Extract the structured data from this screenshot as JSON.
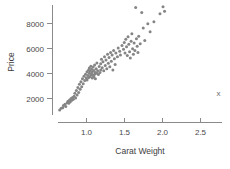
{
  "chart_data": {
    "type": "scatter",
    "title": "",
    "xlabel": "Carat Weight",
    "ylabel": "Price",
    "xlim": [
      0.55,
      2.95
    ],
    "ylim": [
      500,
      9600
    ],
    "xticks": [
      1.0,
      1.5,
      2.0,
      2.5
    ],
    "xtick_labels": [
      "1.0",
      "1.5",
      "2.0",
      "2.5"
    ],
    "yticks": [
      2000,
      4000,
      6000,
      8000
    ],
    "ytick_labels": [
      "2000",
      "4000",
      "6000",
      "8000"
    ],
    "grid": false,
    "legend": "none",
    "marker_color": "#858585",
    "marker_size": 3,
    "annotations": [
      {
        "text": "x",
        "x": 2.75,
        "y": 2150
      }
    ],
    "points": [
      {
        "x": 0.66,
        "y": 1050
      },
      {
        "x": 0.68,
        "y": 1180
      },
      {
        "x": 0.7,
        "y": 1220
      },
      {
        "x": 0.71,
        "y": 1400
      },
      {
        "x": 0.73,
        "y": 1500
      },
      {
        "x": 0.74,
        "y": 1320
      },
      {
        "x": 0.76,
        "y": 1620
      },
      {
        "x": 0.77,
        "y": 1750
      },
      {
        "x": 0.78,
        "y": 1580
      },
      {
        "x": 0.79,
        "y": 1850
      },
      {
        "x": 0.8,
        "y": 1700
      },
      {
        "x": 0.81,
        "y": 1960
      },
      {
        "x": 0.82,
        "y": 1820
      },
      {
        "x": 0.83,
        "y": 2050
      },
      {
        "x": 0.84,
        "y": 1900
      },
      {
        "x": 0.85,
        "y": 2150
      },
      {
        "x": 0.86,
        "y": 2380
      },
      {
        "x": 0.87,
        "y": 2000
      },
      {
        "x": 0.88,
        "y": 2600
      },
      {
        "x": 0.89,
        "y": 2250
      },
      {
        "x": 0.9,
        "y": 2850
      },
      {
        "x": 0.91,
        "y": 2450
      },
      {
        "x": 0.92,
        "y": 3100
      },
      {
        "x": 0.93,
        "y": 2700
      },
      {
        "x": 0.94,
        "y": 3300
      },
      {
        "x": 0.95,
        "y": 2900
      },
      {
        "x": 0.96,
        "y": 3550
      },
      {
        "x": 0.97,
        "y": 3150
      },
      {
        "x": 0.98,
        "y": 3750
      },
      {
        "x": 0.99,
        "y": 3400
      },
      {
        "x": 1.0,
        "y": 3900
      },
      {
        "x": 1.01,
        "y": 3600
      },
      {
        "x": 1.02,
        "y": 4100
      },
      {
        "x": 1.02,
        "y": 3450
      },
      {
        "x": 1.03,
        "y": 3800
      },
      {
        "x": 1.04,
        "y": 4250
      },
      {
        "x": 1.04,
        "y": 3620
      },
      {
        "x": 1.05,
        "y": 3980
      },
      {
        "x": 1.05,
        "y": 4400
      },
      {
        "x": 1.06,
        "y": 3700
      },
      {
        "x": 1.06,
        "y": 4150
      },
      {
        "x": 1.07,
        "y": 3850
      },
      {
        "x": 1.07,
        "y": 4550
      },
      {
        "x": 1.08,
        "y": 3950
      },
      {
        "x": 1.08,
        "y": 4300
      },
      {
        "x": 1.09,
        "y": 3600
      },
      {
        "x": 1.09,
        "y": 4100
      },
      {
        "x": 1.1,
        "y": 3820
      },
      {
        "x": 1.1,
        "y": 4480
      },
      {
        "x": 1.11,
        "y": 3700
      },
      {
        "x": 1.11,
        "y": 4200
      },
      {
        "x": 1.12,
        "y": 3900
      },
      {
        "x": 1.12,
        "y": 4650
      },
      {
        "x": 1.13,
        "y": 4050
      },
      {
        "x": 1.13,
        "y": 3550
      },
      {
        "x": 1.14,
        "y": 4350
      },
      {
        "x": 1.15,
        "y": 3980
      },
      {
        "x": 1.15,
        "y": 4800
      },
      {
        "x": 1.16,
        "y": 4180
      },
      {
        "x": 1.17,
        "y": 3880
      },
      {
        "x": 1.18,
        "y": 4520
      },
      {
        "x": 1.19,
        "y": 4050
      },
      {
        "x": 1.2,
        "y": 4750
      },
      {
        "x": 1.2,
        "y": 4250
      },
      {
        "x": 1.21,
        "y": 5100
      },
      {
        "x": 1.22,
        "y": 4420
      },
      {
        "x": 1.23,
        "y": 4900
      },
      {
        "x": 1.24,
        "y": 4180
      },
      {
        "x": 1.25,
        "y": 5300
      },
      {
        "x": 1.26,
        "y": 4600
      },
      {
        "x": 1.27,
        "y": 5050
      },
      {
        "x": 1.28,
        "y": 4350
      },
      {
        "x": 1.29,
        "y": 5500
      },
      {
        "x": 1.3,
        "y": 4780
      },
      {
        "x": 1.31,
        "y": 5250
      },
      {
        "x": 1.32,
        "y": 4500
      },
      {
        "x": 1.33,
        "y": 5650
      },
      {
        "x": 1.34,
        "y": 4950
      },
      {
        "x": 1.35,
        "y": 5450
      },
      {
        "x": 1.36,
        "y": 4250
      },
      {
        "x": 1.37,
        "y": 5800
      },
      {
        "x": 1.38,
        "y": 5150
      },
      {
        "x": 1.39,
        "y": 4680
      },
      {
        "x": 1.4,
        "y": 5600
      },
      {
        "x": 1.42,
        "y": 5300
      },
      {
        "x": 1.43,
        "y": 6000
      },
      {
        "x": 1.45,
        "y": 5750
      },
      {
        "x": 1.46,
        "y": 5450
      },
      {
        "x": 1.48,
        "y": 6200
      },
      {
        "x": 1.5,
        "y": 5900
      },
      {
        "x": 1.51,
        "y": 6450
      },
      {
        "x": 1.52,
        "y": 5600
      },
      {
        "x": 1.53,
        "y": 6700
      },
      {
        "x": 1.54,
        "y": 6100
      },
      {
        "x": 1.55,
        "y": 5400
      },
      {
        "x": 1.56,
        "y": 6900
      },
      {
        "x": 1.57,
        "y": 6300
      },
      {
        "x": 1.58,
        "y": 5700
      },
      {
        "x": 1.59,
        "y": 5200
      },
      {
        "x": 1.6,
        "y": 6550
      },
      {
        "x": 1.61,
        "y": 7150
      },
      {
        "x": 1.62,
        "y": 5950
      },
      {
        "x": 1.63,
        "y": 5500
      },
      {
        "x": 1.64,
        "y": 6400
      },
      {
        "x": 1.65,
        "y": 5800
      },
      {
        "x": 1.66,
        "y": 9250
      },
      {
        "x": 1.67,
        "y": 6750
      },
      {
        "x": 1.68,
        "y": 6150
      },
      {
        "x": 1.69,
        "y": 5650
      },
      {
        "x": 1.7,
        "y": 6950
      },
      {
        "x": 1.72,
        "y": 6350
      },
      {
        "x": 1.74,
        "y": 8850
      },
      {
        "x": 1.76,
        "y": 7600
      },
      {
        "x": 1.78,
        "y": 6600
      },
      {
        "x": 1.82,
        "y": 7950
      },
      {
        "x": 1.85,
        "y": 7300
      },
      {
        "x": 1.9,
        "y": 8100
      },
      {
        "x": 1.98,
        "y": 8750
      },
      {
        "x": 2.02,
        "y": 9300
      },
      {
        "x": 2.04,
        "y": 8950
      }
    ]
  }
}
